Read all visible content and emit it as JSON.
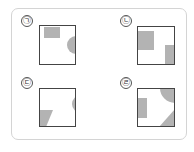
{
  "figure": {
    "colors": {
      "frame": "#d4d4d4",
      "square_border": "#444444",
      "shape_fill": "#b3b3b3"
    },
    "panels": [
      {
        "id": "a",
        "label": "㉠",
        "shapes": [
          "top-left rectangle",
          "right-edge half circle"
        ]
      },
      {
        "id": "b",
        "label": "㉡",
        "shapes": [
          "left rectangle",
          "bottom-right rectangle"
        ]
      },
      {
        "id": "c",
        "label": "㉢",
        "shapes": [
          "bottom-left trapezoid",
          "right-edge partial circle"
        ]
      },
      {
        "id": "d",
        "label": "㉣",
        "shapes": [
          "left rectangle",
          "top-right circle segment",
          "bottom-right triangle"
        ]
      }
    ]
  }
}
